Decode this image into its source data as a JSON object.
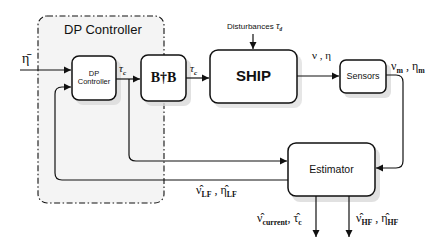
{
  "container": {
    "title": "DP Controller"
  },
  "blocks": {
    "dp_controller": {
      "line1": "DP",
      "line2": "Controller"
    },
    "allocation": {
      "label": "B†B"
    },
    "ship": {
      "label": "SHIP"
    },
    "sensors": {
      "label": "Sensors"
    },
    "estimator": {
      "label": "Estimator"
    }
  },
  "signals": {
    "reference": "η̄",
    "tau_c_ctrl": "τc",
    "tau_c_ctrl_sym": "τ",
    "tau_c_ctrl_sub": "c",
    "tau_c_alloc_sym": "τ",
    "tau_c_alloc_sub": "c",
    "disturbances_text": "Disturbances ",
    "disturbances_sym": "τ",
    "disturbances_sub": "d",
    "ship_out": "ν , η",
    "sensor_out_nu": "ν",
    "sensor_out_nu_sub": "m",
    "sensor_out_eta": "η",
    "sensor_out_eta_sub": "m",
    "lf_nu": "ν̂",
    "lf_nu_sub": "LF",
    "lf_eta": "η̂",
    "lf_eta_sub": "LF",
    "current_nu": "ν̂",
    "current_nu_sub": "current",
    "current_tau": "τ̂",
    "current_tau_sub": "c",
    "hf_nu": "ν̂",
    "hf_nu_sub": "HF",
    "hf_eta": "η̂",
    "hf_eta_sub": "HF"
  },
  "colors": {
    "line": "#111111",
    "container_fill": "#f4f4f4",
    "shadow": "#d9d9d9"
  }
}
